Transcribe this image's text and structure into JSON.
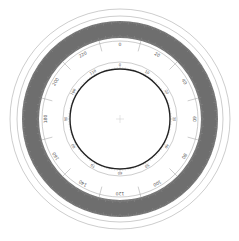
{
  "diagram": {
    "type": "circular-scale-dial",
    "center": [
      120,
      119
    ],
    "colors": {
      "background": "#ffffff",
      "thin_line": "#9a9a9a",
      "band": "#6e6e6e",
      "inner_bold": "#222222",
      "label": "#555555"
    },
    "rings": {
      "outer_thin_1": 110,
      "outer_thin_2": 103,
      "band_outer": 98,
      "band_inner": 81,
      "scale_circle": 78,
      "inner_thin": 57,
      "inner_bold": 50
    },
    "outer_labels": [
      "0",
      "20",
      "40",
      "60",
      "80",
      "100",
      "120",
      "140",
      "160",
      "180",
      "200",
      "220"
    ],
    "inner_labels": [
      "0",
      "10",
      "20",
      "30",
      "40",
      "50",
      "60",
      "70",
      "80",
      "90",
      "100",
      "110"
    ]
  }
}
